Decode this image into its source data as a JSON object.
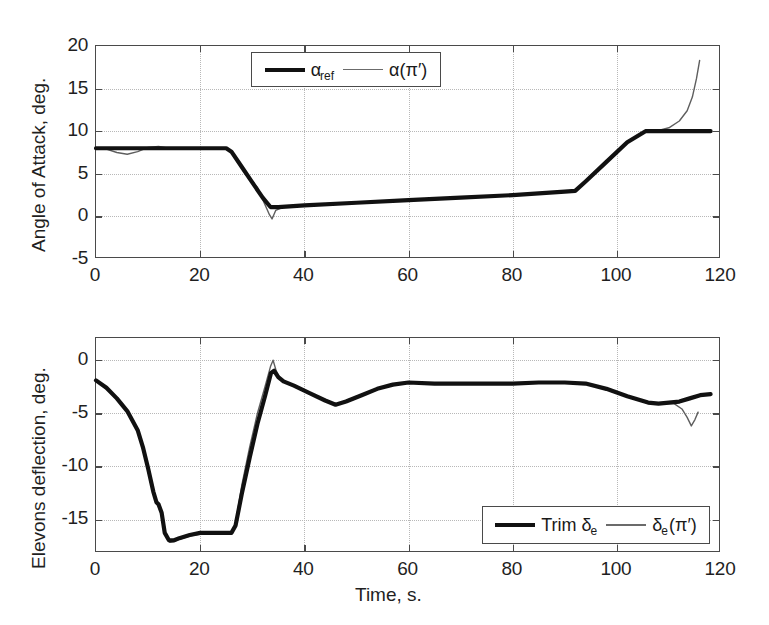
{
  "figure": {
    "background": "#ffffff",
    "width": 769,
    "height": 625
  },
  "colors": {
    "reference_line": "#111111",
    "actual_line": "#5e5e5e",
    "axis": "#4a4a4a",
    "grid": "#b8b8b8",
    "text": "#1f1f1f"
  },
  "shared": {
    "xlabel": "Time, s.",
    "x_ticks": [
      0,
      20,
      40,
      60,
      80,
      100,
      120
    ],
    "x_tick_labels": [
      "0",
      "20",
      "40",
      "60",
      "80",
      "100",
      "120"
    ],
    "xlim": [
      0,
      120
    ]
  },
  "chart_data": [
    {
      "id": "angle-of-attack",
      "type": "line",
      "title": "",
      "xlabel": "",
      "ylabel": "Angle of Attack, deg.",
      "xlim": [
        0,
        120
      ],
      "ylim": [
        -5,
        20
      ],
      "x_ticks": [
        0,
        20,
        40,
        60,
        80,
        100,
        120
      ],
      "x_tick_labels": [
        "0",
        "20",
        "40",
        "60",
        "80",
        "100",
        "120"
      ],
      "y_ticks": [
        -5,
        0,
        5,
        10,
        15,
        20
      ],
      "y_tick_labels": [
        "-5",
        "0",
        "5",
        "10",
        "15",
        "20"
      ],
      "grid": true,
      "legend_position": "top-center",
      "series": [
        {
          "name": "alpha_ref",
          "label": "α",
          "label_sub": "ref",
          "style": "thick-black",
          "points": [
            [
              0,
              8.0
            ],
            [
              4,
              8.0
            ],
            [
              8,
              8.0
            ],
            [
              12,
              8.0
            ],
            [
              16,
              8.0
            ],
            [
              20,
              8.0
            ],
            [
              24,
              8.0
            ],
            [
              25,
              8.0
            ],
            [
              26,
              7.6
            ],
            [
              28,
              5.8
            ],
            [
              30,
              4.0
            ],
            [
              32,
              2.2
            ],
            [
              33.5,
              1.1
            ],
            [
              35,
              1.1
            ],
            [
              40,
              1.3
            ],
            [
              50,
              1.6
            ],
            [
              60,
              1.9
            ],
            [
              70,
              2.2
            ],
            [
              80,
              2.5
            ],
            [
              90,
              2.9
            ],
            [
              92,
              3.0
            ],
            [
              94,
              4.1
            ],
            [
              98,
              6.4
            ],
            [
              102,
              8.7
            ],
            [
              105.5,
              10.0
            ],
            [
              110,
              10.0
            ],
            [
              115,
              10.0
            ],
            [
              118,
              10.0
            ]
          ]
        },
        {
          "name": "alpha_pi",
          "label": "α(π′)",
          "style": "thin-gray",
          "points": [
            [
              0,
              8.0
            ],
            [
              2,
              7.9
            ],
            [
              4,
              7.5
            ],
            [
              6,
              7.3
            ],
            [
              8,
              7.6
            ],
            [
              10,
              8.1
            ],
            [
              12,
              8.2
            ],
            [
              14,
              8.0
            ],
            [
              18,
              8.0
            ],
            [
              22,
              8.0
            ],
            [
              25,
              8.0
            ],
            [
              26,
              7.5
            ],
            [
              28,
              5.6
            ],
            [
              29.5,
              4.3
            ],
            [
              31,
              3.4
            ],
            [
              32,
              2.0
            ],
            [
              33.3,
              0.2
            ],
            [
              33.8,
              -0.3
            ],
            [
              34.5,
              0.7
            ],
            [
              36,
              1.1
            ],
            [
              42,
              1.3
            ],
            [
              52,
              1.7
            ],
            [
              62,
              2.0
            ],
            [
              72,
              2.3
            ],
            [
              82,
              2.6
            ],
            [
              90,
              2.9
            ],
            [
              92,
              3.0
            ],
            [
              94,
              4.2
            ],
            [
              98,
              6.5
            ],
            [
              102,
              8.8
            ],
            [
              105.5,
              10.0
            ],
            [
              108,
              10.1
            ],
            [
              110,
              10.4
            ],
            [
              112,
              11.2
            ],
            [
              113.5,
              12.4
            ],
            [
              114.5,
              14.0
            ],
            [
              115.3,
              16.2
            ],
            [
              115.9,
              18.3
            ]
          ]
        }
      ]
    },
    {
      "id": "elevons-deflection",
      "type": "line",
      "title": "",
      "xlabel": "Time, s.",
      "ylabel": "Elevons deflection, deg.",
      "xlim": [
        0,
        120
      ],
      "ylim": [
        -18.2,
        2.1
      ],
      "x_ticks": [
        0,
        20,
        40,
        60,
        80,
        100,
        120
      ],
      "x_tick_labels": [
        "0",
        "20",
        "40",
        "60",
        "80",
        "100",
        "120"
      ],
      "y_ticks": [
        -15,
        -10,
        -5,
        0
      ],
      "y_tick_labels": [
        "-15",
        "-10",
        "-5",
        "0"
      ],
      "grid": true,
      "legend_position": "bottom-right",
      "series": [
        {
          "name": "trim_delta_e",
          "label": "Trim δ",
          "label_sub": "e",
          "style": "thick-black",
          "points": [
            [
              0,
              -1.9
            ],
            [
              2,
              -2.6
            ],
            [
              4,
              -3.6
            ],
            [
              6,
              -4.8
            ],
            [
              8,
              -6.6
            ],
            [
              9,
              -8.2
            ],
            [
              10,
              -10.2
            ],
            [
              11,
              -12.4
            ],
            [
              11.6,
              -13.4
            ],
            [
              12,
              -13.6
            ],
            [
              12.6,
              -14.4
            ],
            [
              13.2,
              -16.3
            ],
            [
              14,
              -17.0
            ],
            [
              15,
              -17.0
            ],
            [
              16,
              -16.8
            ],
            [
              18,
              -16.5
            ],
            [
              20,
              -16.3
            ],
            [
              22,
              -16.3
            ],
            [
              24,
              -16.3
            ],
            [
              26,
              -16.3
            ],
            [
              26.8,
              -15.6
            ],
            [
              28,
              -12.6
            ],
            [
              29.5,
              -9.2
            ],
            [
              31,
              -6.0
            ],
            [
              32.5,
              -3.3
            ],
            [
              33.6,
              -1.2
            ],
            [
              34.2,
              -1.0
            ],
            [
              35,
              -1.6
            ],
            [
              36,
              -2.0
            ],
            [
              38,
              -2.4
            ],
            [
              41,
              -3.1
            ],
            [
              44,
              -3.8
            ],
            [
              46,
              -4.2
            ],
            [
              48,
              -3.9
            ],
            [
              51,
              -3.3
            ],
            [
              54,
              -2.7
            ],
            [
              57,
              -2.3
            ],
            [
              60,
              -2.1
            ],
            [
              65,
              -2.2
            ],
            [
              70,
              -2.2
            ],
            [
              75,
              -2.2
            ],
            [
              80,
              -2.2
            ],
            [
              85,
              -2.1
            ],
            [
              90,
              -2.1
            ],
            [
              94,
              -2.2
            ],
            [
              98,
              -2.7
            ],
            [
              102,
              -3.4
            ],
            [
              106,
              -4.0
            ],
            [
              108,
              -4.1
            ],
            [
              110,
              -4.0
            ],
            [
              112,
              -3.9
            ],
            [
              114,
              -3.6
            ],
            [
              116,
              -3.3
            ],
            [
              118,
              -3.2
            ]
          ]
        },
        {
          "name": "delta_e_pi",
          "label": "δ",
          "label_sub": "e",
          "label_tail": "(π′)",
          "style": "thin-gray",
          "points": [
            [
              0,
              -1.9
            ],
            [
              2,
              -2.7
            ],
            [
              4,
              -3.7
            ],
            [
              6,
              -4.9
            ],
            [
              8,
              -6.7
            ],
            [
              9,
              -8.3
            ],
            [
              10,
              -10.4
            ],
            [
              11,
              -12.5
            ],
            [
              11.6,
              -13.5
            ],
            [
              12,
              -13.7
            ],
            [
              12.8,
              -14.6
            ],
            [
              13.4,
              -16.5
            ],
            [
              14.2,
              -17.2
            ],
            [
              15,
              -17.1
            ],
            [
              16,
              -16.9
            ],
            [
              18,
              -16.6
            ],
            [
              20,
              -16.4
            ],
            [
              22,
              -16.4
            ],
            [
              24,
              -16.4
            ],
            [
              26,
              -16.4
            ],
            [
              26.8,
              -15.4
            ],
            [
              28,
              -11.8
            ],
            [
              29.5,
              -8.2
            ],
            [
              31,
              -5.0
            ],
            [
              32.5,
              -2.4
            ],
            [
              33.5,
              -0.6
            ],
            [
              34.0,
              0.0
            ],
            [
              34.6,
              -1.0
            ],
            [
              35.4,
              -1.8
            ],
            [
              37,
              -2.2
            ],
            [
              40,
              -2.8
            ],
            [
              43,
              -3.6
            ],
            [
              46,
              -4.2
            ],
            [
              49,
              -3.7
            ],
            [
              52,
              -3.1
            ],
            [
              55,
              -2.6
            ],
            [
              58,
              -2.2
            ],
            [
              61,
              -2.1
            ],
            [
              66,
              -2.2
            ],
            [
              71,
              -2.2
            ],
            [
              76,
              -2.2
            ],
            [
              81,
              -2.2
            ],
            [
              86,
              -2.1
            ],
            [
              91,
              -2.1
            ],
            [
              95,
              -2.3
            ],
            [
              99,
              -2.9
            ],
            [
              103,
              -3.5
            ],
            [
              106.5,
              -4.1
            ],
            [
              109,
              -4.1
            ],
            [
              111,
              -4.1
            ],
            [
              112.5,
              -4.6
            ],
            [
              113.5,
              -5.4
            ],
            [
              114.3,
              -6.2
            ],
            [
              115,
              -5.6
            ],
            [
              115.6,
              -4.9
            ]
          ]
        }
      ]
    }
  ]
}
